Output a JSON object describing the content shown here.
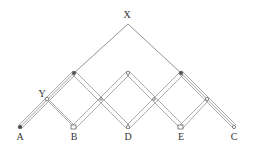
{
  "diagram": {
    "labels": {
      "X": "X",
      "Y": "Y",
      "A": "A",
      "B": "B",
      "D": "D",
      "E": "E",
      "C": "C"
    },
    "colors": {
      "line": "#7a7a7a",
      "node": "#555555",
      "background": "#ffffff"
    },
    "nodes": {
      "apex": [
        128,
        24
      ],
      "top": [
        [
          74,
          73
        ],
        [
          128,
          73
        ],
        [
          181,
          73
        ]
      ],
      "middle": [
        [
          47,
          99
        ],
        [
          101,
          99
        ],
        [
          154,
          99
        ],
        [
          207,
          99
        ]
      ],
      "bottom": [
        [
          20,
          127
        ],
        [
          74,
          127
        ],
        [
          128,
          127
        ],
        [
          181,
          127
        ],
        [
          234,
          127
        ]
      ]
    }
  }
}
